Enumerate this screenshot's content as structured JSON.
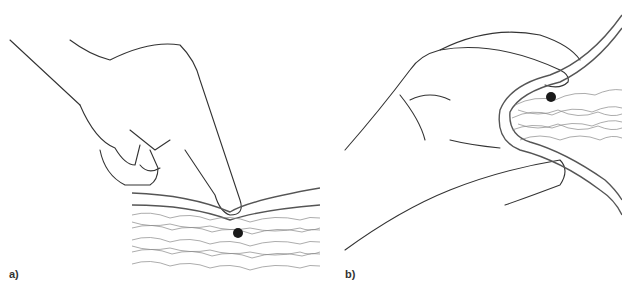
{
  "figure": {
    "panels": [
      {
        "id": "a",
        "label": "a)",
        "description": "Finger pressing down on tissue surface with marked point below"
      },
      {
        "id": "b",
        "label": "b)",
        "description": "Thumb and fingers pinching a fold of tissue with marked point inside"
      }
    ],
    "colors": {
      "line": "#333333",
      "tissue": "#888888",
      "marker": "#1a1a1a",
      "background": "#ffffff"
    }
  }
}
